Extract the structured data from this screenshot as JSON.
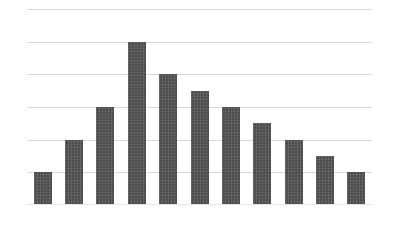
{
  "chart_data": {
    "type": "bar",
    "title": "",
    "subtitle": "",
    "xlabel": "",
    "ylabel": "",
    "categories": [
      "1",
      "2",
      "3",
      "4",
      "5",
      "6",
      "7",
      "8",
      "9",
      "10",
      "11"
    ],
    "values": [
      1.0,
      2.0,
      3.0,
      5.0,
      4.0,
      3.5,
      3.0,
      2.5,
      2.0,
      1.5,
      1.0
    ],
    "series": [
      {
        "name": "",
        "values": [
          1.0,
          2.0,
          3.0,
          5.0,
          4.0,
          3.5,
          3.0,
          2.5,
          2.0,
          1.5,
          1.0
        ]
      }
    ],
    "ylim": [
      0,
      6
    ],
    "xlim": [
      0,
      11
    ],
    "y_gridline_values": [
      6,
      5,
      4,
      3,
      2,
      1
    ],
    "y_tick_labels": [],
    "x_tick_labels": [],
    "grid": true,
    "grid_axis": "y",
    "grid_color": "#d9d9d9",
    "legend": false,
    "legend_position": "none",
    "annotations": [],
    "bar_color": "#4d4d4d",
    "background_color": "#ffffff",
    "bar_count": 11,
    "peak_category": "4",
    "peak_value": 5.0
  },
  "figure": {
    "width_px": 393,
    "height_px": 231,
    "plot_left_px": 27,
    "plot_right_px": 372,
    "plot_top_px": 9,
    "plot_baseline_px": 205
  }
}
